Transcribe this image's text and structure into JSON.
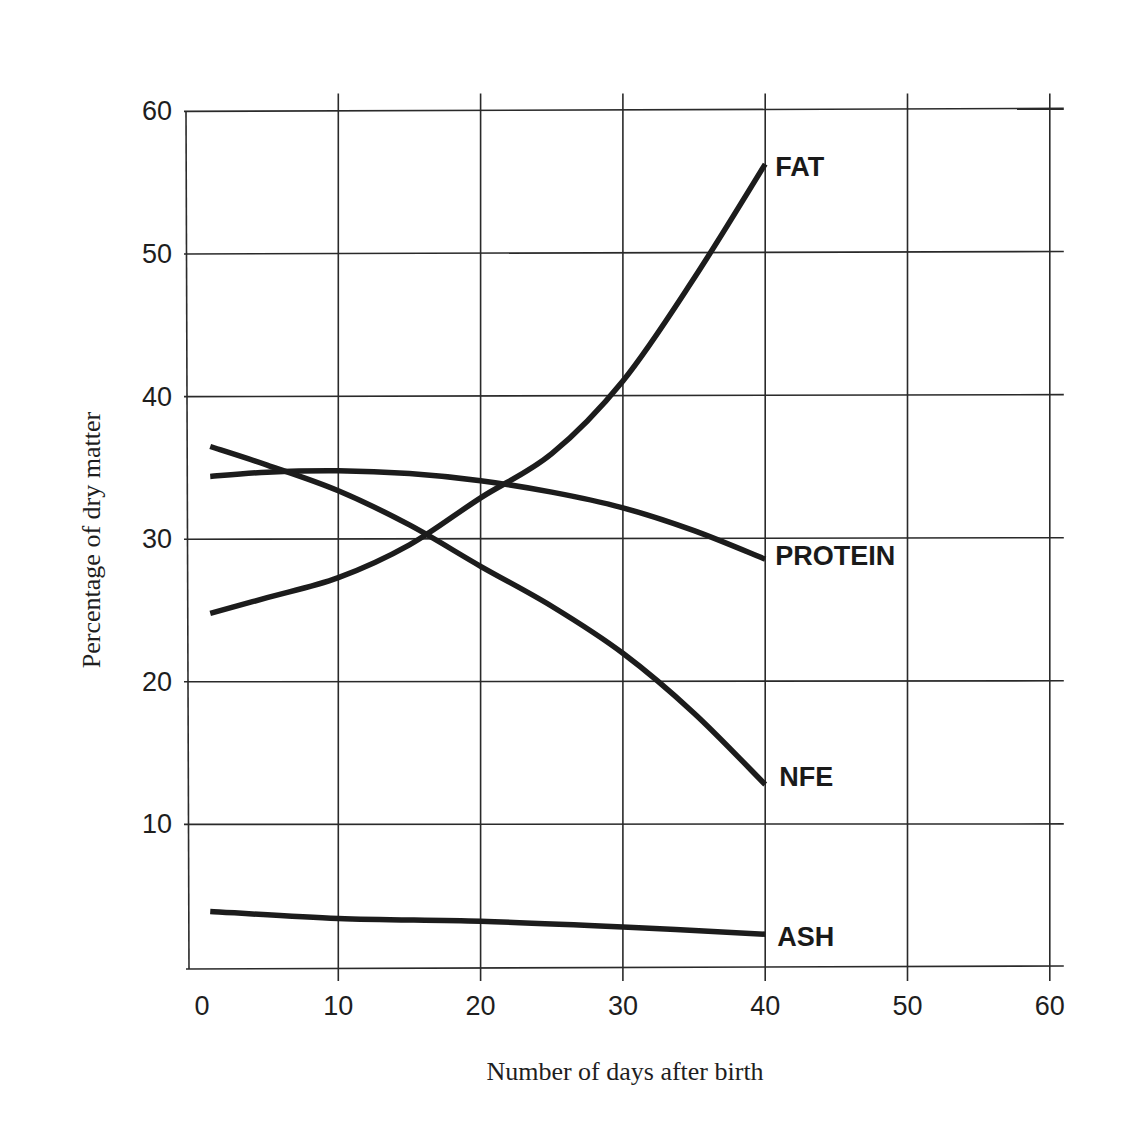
{
  "chart_data": {
    "type": "line",
    "title": "",
    "xlabel": "Number of days after birth",
    "ylabel": "Percentage of dry matter",
    "xlim": [
      0,
      60
    ],
    "ylim": [
      0,
      60
    ],
    "x_ticks": [
      0,
      10,
      20,
      30,
      40,
      50,
      60
    ],
    "y_ticks": [
      10,
      20,
      30,
      40,
      50,
      60
    ],
    "grid": true,
    "legend_position": "inline labels at right end of each curve",
    "series": [
      {
        "name": "FAT",
        "x": [
          1,
          5,
          10,
          15,
          20,
          25,
          30,
          35,
          40
        ],
        "values": [
          24.8,
          25.9,
          27.3,
          29.6,
          32.9,
          36.0,
          41.1,
          48.3,
          56.3
        ]
      },
      {
        "name": "PROTEIN",
        "x": [
          1,
          5,
          10,
          15,
          20,
          25,
          30,
          35,
          40
        ],
        "values": [
          34.4,
          34.7,
          34.8,
          34.6,
          34.1,
          33.3,
          32.2,
          30.6,
          28.6
        ]
      },
      {
        "name": "NFE",
        "x": [
          1,
          5,
          10,
          15,
          20,
          25,
          30,
          35,
          40
        ],
        "values": [
          36.5,
          35.2,
          33.4,
          31.0,
          28.1,
          25.3,
          22.0,
          17.8,
          12.8
        ]
      },
      {
        "name": "ASH",
        "x": [
          1,
          10,
          20,
          30,
          40
        ],
        "values": [
          3.9,
          3.4,
          3.2,
          2.8,
          2.3
        ]
      }
    ]
  },
  "labels": {
    "x_axis_title": "Number of days after birth",
    "y_axis_title": "Percentage of dry matter",
    "series": [
      "FAT",
      "PROTEIN",
      "NFE",
      "ASH"
    ]
  }
}
